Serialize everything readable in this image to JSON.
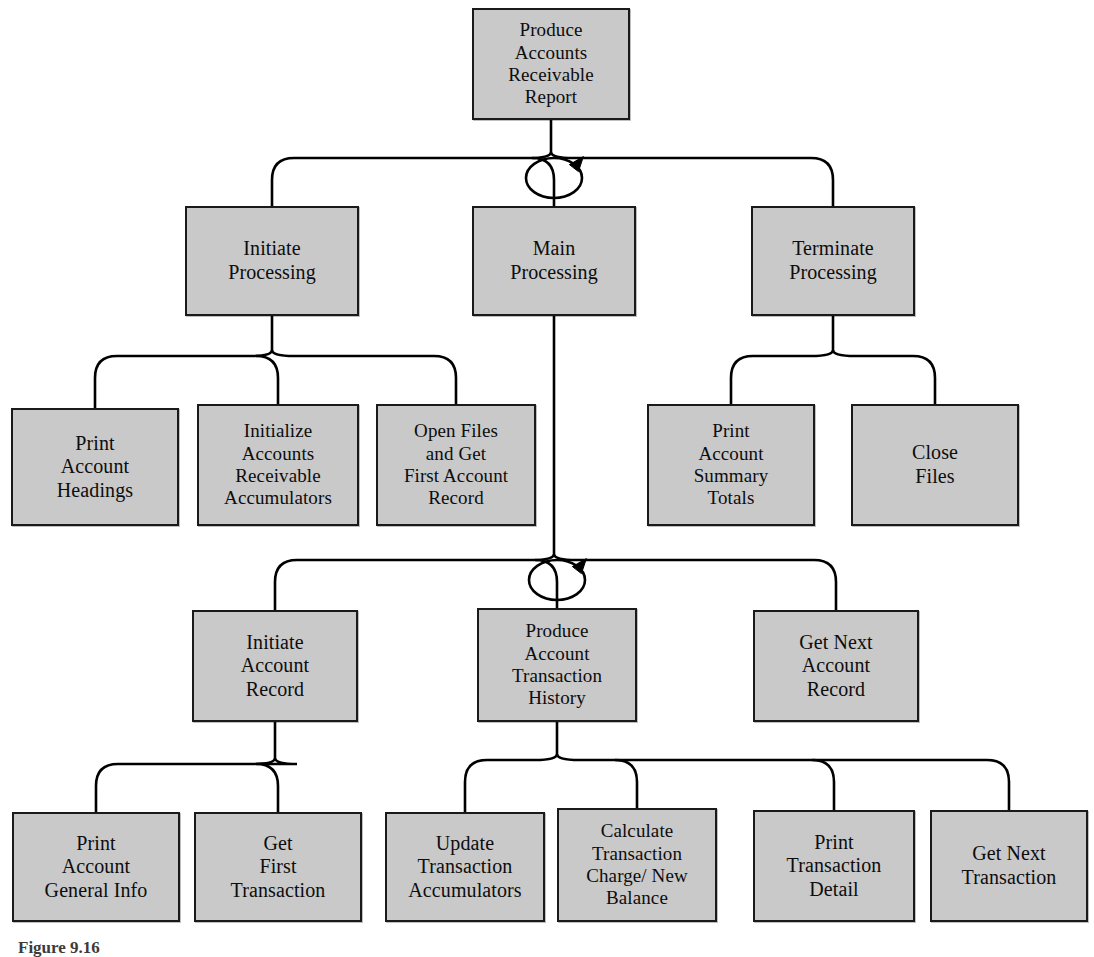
{
  "diagram": {
    "caption": "Figure 9.16",
    "colors": {
      "box_fill": "#c9c9c9",
      "box_border": "#1a1a1a",
      "connector": "#000000",
      "text": "#0d0d0d",
      "background": "#ffffff"
    },
    "nodes": [
      {
        "id": "produce-accounts-receivable-report",
        "label": "Produce\nAccounts\nReceivable\nReport",
        "level": 0,
        "x": 472,
        "y": 8,
        "w": 158,
        "h": 112
      },
      {
        "id": "initiate-processing",
        "label": "Initiate\nProcessing",
        "level": 1,
        "x": 185,
        "y": 206,
        "w": 174,
        "h": 110
      },
      {
        "id": "main-processing",
        "label": "Main\nProcessing",
        "level": 1,
        "x": 472,
        "y": 206,
        "w": 164,
        "h": 110
      },
      {
        "id": "terminate-processing",
        "label": "Terminate\nProcessing",
        "level": 1,
        "x": 751,
        "y": 206,
        "w": 164,
        "h": 110
      },
      {
        "id": "print-account-headings",
        "label": "Print\nAccount\nHeadings",
        "level": 2,
        "x": 11,
        "y": 408,
        "w": 168,
        "h": 118
      },
      {
        "id": "initialize-accounts-receivable-accumulators",
        "label": "Initialize\nAccounts\nReceivable\nAccumulators",
        "level": 2,
        "x": 197,
        "y": 404,
        "w": 162,
        "h": 122
      },
      {
        "id": "open-files-and-get-first-account-record",
        "label": "Open Files\nand Get\nFirst Account\nRecord",
        "level": 2,
        "x": 376,
        "y": 404,
        "w": 160,
        "h": 122
      },
      {
        "id": "print-account-summary-totals",
        "label": "Print\nAccount\nSummary\nTotals",
        "level": 2,
        "x": 647,
        "y": 404,
        "w": 168,
        "h": 122
      },
      {
        "id": "close-files",
        "label": "Close\nFiles",
        "level": 2,
        "x": 851,
        "y": 404,
        "w": 168,
        "h": 122
      },
      {
        "id": "initiate-account-record",
        "label": "Initiate\nAccount\nRecord",
        "level": 3,
        "x": 192,
        "y": 610,
        "w": 166,
        "h": 112
      },
      {
        "id": "produce-account-transaction-history",
        "label": "Produce\nAccount\nTransaction\nHistory",
        "level": 3,
        "x": 477,
        "y": 608,
        "w": 160,
        "h": 114
      },
      {
        "id": "get-next-account-record",
        "label": "Get Next\nAccount\nRecord",
        "level": 3,
        "x": 753,
        "y": 610,
        "w": 166,
        "h": 112
      },
      {
        "id": "print-account-general-info",
        "label": "Print\nAccount\nGeneral Info",
        "level": 4,
        "x": 12,
        "y": 812,
        "w": 168,
        "h": 110
      },
      {
        "id": "get-first-transaction",
        "label": "Get\nFirst\nTransaction",
        "level": 4,
        "x": 194,
        "y": 812,
        "w": 168,
        "h": 110
      },
      {
        "id": "update-transaction-accumulators",
        "label": "Update\nTransaction\nAccumulators",
        "level": 4,
        "x": 385,
        "y": 812,
        "w": 160,
        "h": 110
      },
      {
        "id": "calculate-transaction-charge-new-balance",
        "label": "Calculate\nTransaction\nCharge/ New\nBalance",
        "level": 4,
        "x": 557,
        "y": 808,
        "w": 160,
        "h": 114
      },
      {
        "id": "print-transaction-detail",
        "label": "Print\nTransaction\nDetail",
        "level": 4,
        "x": 753,
        "y": 810,
        "w": 162,
        "h": 112
      },
      {
        "id": "get-next-transaction",
        "label": "Get Next\nTransaction",
        "level": 4,
        "x": 930,
        "y": 810,
        "w": 158,
        "h": 112
      }
    ],
    "edges": [
      {
        "from": "produce-accounts-receivable-report",
        "to": "initiate-processing"
      },
      {
        "from": "produce-accounts-receivable-report",
        "to": "main-processing"
      },
      {
        "from": "produce-accounts-receivable-report",
        "to": "terminate-processing"
      },
      {
        "from": "initiate-processing",
        "to": "print-account-headings"
      },
      {
        "from": "initiate-processing",
        "to": "initialize-accounts-receivable-accumulators"
      },
      {
        "from": "initiate-processing",
        "to": "open-files-and-get-first-account-record"
      },
      {
        "from": "terminate-processing",
        "to": "print-account-summary-totals"
      },
      {
        "from": "terminate-processing",
        "to": "close-files"
      },
      {
        "from": "main-processing",
        "to": "initiate-account-record"
      },
      {
        "from": "main-processing",
        "to": "produce-account-transaction-history"
      },
      {
        "from": "main-processing",
        "to": "get-next-account-record"
      },
      {
        "from": "initiate-account-record",
        "to": "print-account-general-info"
      },
      {
        "from": "initiate-account-record",
        "to": "get-first-transaction"
      },
      {
        "from": "produce-account-transaction-history",
        "to": "update-transaction-accumulators"
      },
      {
        "from": "produce-account-transaction-history",
        "to": "calculate-transaction-charge-new-balance"
      },
      {
        "from": "produce-account-transaction-history",
        "to": "print-transaction-detail"
      },
      {
        "from": "produce-account-transaction-history",
        "to": "get-next-transaction"
      }
    ],
    "loops": [
      {
        "id": "main-processing-loop",
        "cx": 554,
        "cy": 178,
        "rx": 28,
        "ry": 20
      },
      {
        "id": "produce-account-transaction-history-loop",
        "cx": 557,
        "cy": 580,
        "rx": 28,
        "ry": 20
      }
    ]
  }
}
